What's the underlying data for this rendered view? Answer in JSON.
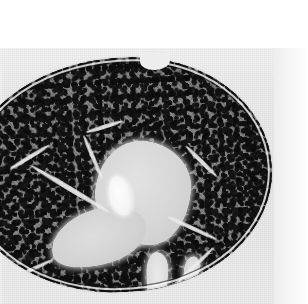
{
  "image": {
    "kind": "photomicrograph",
    "modality": "brightfield light microscopy",
    "staining_appearance": "grayscale / monochrome",
    "subject": "histological tissue section",
    "tissue_identification": "lymphoid organ cross-section (lymph node / thymus-like)",
    "orientation": "transverse section",
    "caption": "",
    "title": "",
    "scale_bar": "",
    "magnification_label": "",
    "annotations": [],
    "visible_text": []
  },
  "canvas": {
    "width_px": 308,
    "height_px": 304,
    "background_color": "#ffffff",
    "field_color": "#ececec",
    "field_top_px": 48,
    "field_left_px": 0,
    "field_width_px": 294,
    "field_height_px": 256,
    "white_margin_top_px": 48,
    "white_margin_right_px": 14
  },
  "specimen": {
    "name": "tissue-section",
    "shape": "ovoid / broad-bean outline",
    "clipped_edges": [
      "left"
    ],
    "bounding_box": {
      "x": -34,
      "y": 58,
      "w": 306,
      "h": 234
    },
    "rotation_deg": -3.2,
    "capsule": {
      "name": "capsule",
      "description": "thin bright rim enclosing the organ",
      "color": "#f5f5f5",
      "inner_line_color": "#141414"
    },
    "notch": {
      "name": "hilar-notch",
      "description": "indentation at top-centre of the capsule",
      "x": 140,
      "y": 52,
      "w": 30,
      "h": 18
    }
  },
  "regions": [
    {
      "name": "cortex",
      "label": "dense dark granular lymphoid cortex",
      "tone": "dark",
      "mean_gray_hex": "#3a3a3a",
      "texture": "fine dense speckle (tightly packed basophilic nuclei)",
      "coverage_pct": 62
    },
    {
      "name": "medulla",
      "label": "pale central medullary region",
      "tone": "light",
      "mean_gray_hex": "#d6d6d6",
      "bounding_box": {
        "x": 128,
        "y": 84,
        "w": 96,
        "h": 104
      }
    },
    {
      "name": "medulla-lower",
      "label": "pale lower-left medullary extension",
      "tone": "light",
      "mean_gray_hex": "#d2d2d2",
      "bounding_box": {
        "x": 80,
        "y": 150,
        "w": 98,
        "h": 56
      }
    },
    {
      "name": "bright-nodule",
      "label": "bright nodular structure within medulla",
      "tone": "very light",
      "mean_gray_hex": "#f8f8f8",
      "bounding_box": {
        "x": 142,
        "y": 118,
        "w": 22,
        "h": 40
      }
    },
    {
      "name": "vessel-lower-right",
      "label": "elongated pale vessel / sinus, lower right",
      "tone": "light",
      "mean_gray_hex": "#dcdcdc",
      "bounding_box": {
        "x": 174,
        "y": 196,
        "w": 22,
        "h": 58
      }
    },
    {
      "name": "sinus-lower-left",
      "label": "oval pale sinus, lower left",
      "tone": "light",
      "mean_gray_hex": "#d8d8d8",
      "bounding_box": {
        "x": 58,
        "y": 236,
        "w": 60,
        "h": 28
      }
    },
    {
      "name": "sinus-right",
      "label": "small pale sinus, right margin",
      "tone": "light",
      "mean_gray_hex": "#d5d5d5",
      "bounding_box": {
        "x": 212,
        "y": 202,
        "w": 16,
        "h": 30
      }
    }
  ],
  "trabeculae": [
    {
      "name": "trabecula-1",
      "x": 58,
      "y": 126,
      "length": 92,
      "angle_deg": 34
    },
    {
      "name": "trabecula-2",
      "x": 104,
      "y": 96,
      "length": 48,
      "angle_deg": 70
    },
    {
      "name": "trabecula-3",
      "x": 186,
      "y": 214,
      "length": 66,
      "angle_deg": -41
    },
    {
      "name": "trabecula-4",
      "x": 196,
      "y": 172,
      "length": 54,
      "angle_deg": 28
    },
    {
      "name": "trabecula-5",
      "x": 30,
      "y": 206,
      "length": 54,
      "angle_deg": -22
    },
    {
      "name": "trabecula-6",
      "x": 214,
      "y": 106,
      "length": 44,
      "angle_deg": 48
    },
    {
      "name": "trabecula-7",
      "x": 122,
      "y": 66,
      "length": 38,
      "angle_deg": -14
    },
    {
      "name": "trabecula-8",
      "x": 42,
      "y": 92,
      "length": 46,
      "angle_deg": -28
    }
  ],
  "palette": {
    "paper_white": "#ffffff",
    "field_gray": "#ececec",
    "pale_tissue": "#d9d9d9",
    "bright_highlight": "#fdfdfd",
    "mid_tissue": "#8a8a8a",
    "dark_nuclei": "#101010"
  }
}
